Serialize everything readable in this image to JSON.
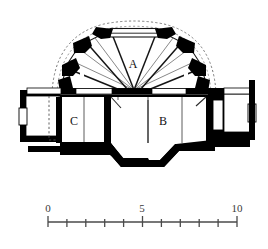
{
  "figure": {
    "kind": "architectural-cross-section",
    "ink_color": "#000000",
    "paper_color": "#ffffff",
    "hidden_line_color": "#555555",
    "rib_line_color": "#6a6a6a",
    "label_color": "#111111"
  },
  "rooms": [
    {
      "id": "A",
      "label": "A",
      "x": 133,
      "y": 65,
      "note": "domed upper interior space"
    },
    {
      "id": "B",
      "label": "B",
      "x": 163,
      "y": 122,
      "note": "main ground-floor hall, right"
    },
    {
      "id": "C",
      "label": "C",
      "x": 74,
      "y": 122,
      "note": "ground-floor space, left"
    }
  ],
  "scale_bar": {
    "units_shown": 10,
    "x_start": 48,
    "x_end": 237,
    "y_axis": 222,
    "tick_count": 11,
    "major_tick_height": 9,
    "minor_tick_height": 6,
    "label_y": 212,
    "labels": [
      {
        "text": "0",
        "value": 0,
        "x": 48
      },
      {
        "text": "5",
        "value": 5,
        "x": 142
      },
      {
        "text": "10",
        "value": 10,
        "x": 237
      }
    ],
    "bar_color": "#4a4a4a"
  }
}
